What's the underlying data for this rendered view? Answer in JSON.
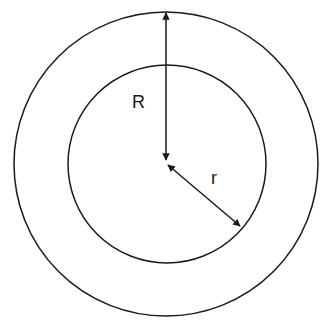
{
  "diagram": {
    "title": "",
    "labels": {
      "outer_radius": "R",
      "inner_radius": "r"
    },
    "shapes": {
      "center": [
        166,
        164
      ],
      "outer_circle_radius": 152,
      "inner_circle_radius": 99
    },
    "colors": {
      "stroke": "#1a1a1a",
      "background": "#ffffff"
    }
  }
}
